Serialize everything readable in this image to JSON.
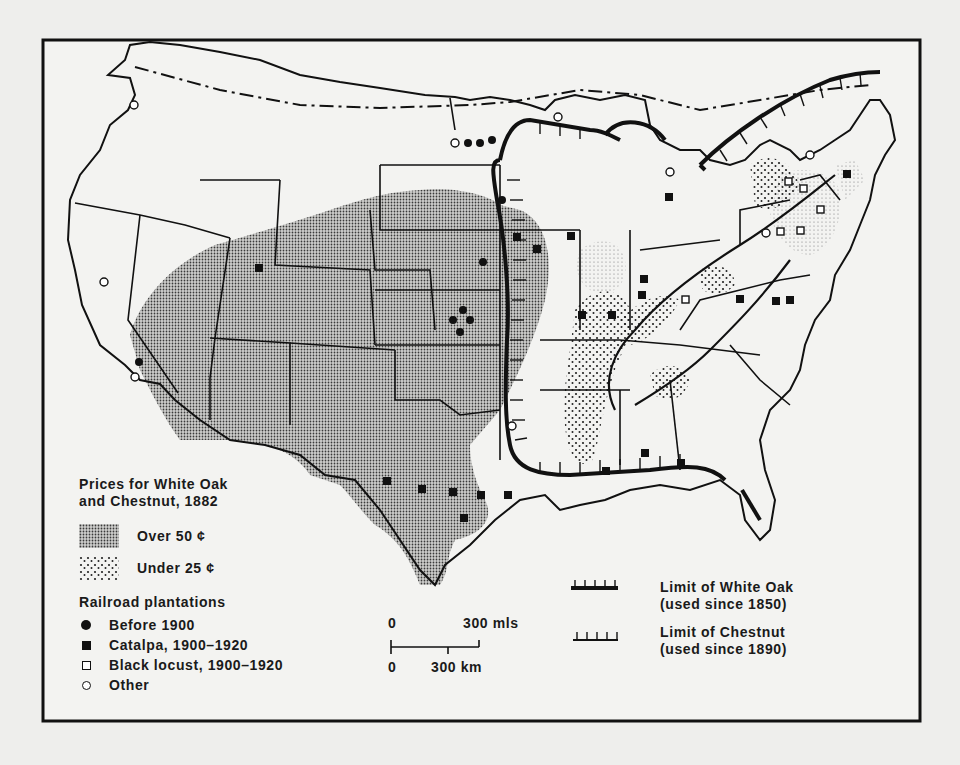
{
  "figure": {
    "legend": {
      "title_line1": "Prices for White Oak",
      "title_line2": "and Chestnut, 1882",
      "price_classes": [
        {
          "label": "Over  50 ¢",
          "pattern": "fine-stipple"
        },
        {
          "label": "Under 25 ¢",
          "pattern": "coarse-stipple"
        }
      ],
      "railroad_title": "Railroad plantations",
      "railroad_items": [
        {
          "label": "Before 1900",
          "symbol": "filled-circle"
        },
        {
          "label": "Catalpa, 1900–1920",
          "symbol": "filled-square"
        },
        {
          "label": "Black locust, 1900–1920",
          "symbol": "open-square"
        },
        {
          "label": "Other",
          "symbol": "open-circle"
        }
      ]
    },
    "scale_bar": {
      "miles_zero": "0",
      "miles_label": "300 mls",
      "km_zero": "0",
      "km_label": "300 km"
    },
    "limits": [
      {
        "line1": "Limit of White Oak",
        "line2": "(used since 1850)",
        "style": "heavy-hachured"
      },
      {
        "line1": "Limit of Chestnut",
        "line2": "(used since 1890)",
        "style": "light-hachured"
      }
    ],
    "colors": {
      "ink": "#111111",
      "paper": "#eeeeec",
      "stipple_fill": "#9a9a98"
    }
  }
}
